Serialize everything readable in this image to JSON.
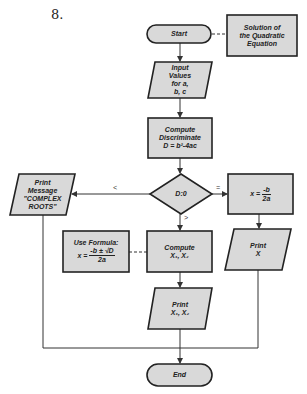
{
  "figure_number": "8.",
  "annotation": {
    "text": "Solution of the Quadratic Equation",
    "lines": [
      "Solution of",
      "the Quadratic",
      "Equation"
    ]
  },
  "nodes": {
    "start": {
      "label": "Start",
      "type": "terminal"
    },
    "input": {
      "lines": [
        "Input",
        "Values",
        "for a,",
        "b, c"
      ],
      "type": "input-output"
    },
    "discriminant": {
      "lines": [
        "Compute",
        "Discriminate",
        "D = b²-4ac"
      ],
      "type": "process"
    },
    "decision": {
      "label": "D:0",
      "type": "decision"
    },
    "complex": {
      "lines": [
        "Print",
        "Message",
        "\"COMPLEX",
        "ROOTS\""
      ],
      "type": "input-output"
    },
    "single_root": {
      "lhs": "x =",
      "numerator": "-b",
      "denominator": "2a",
      "type": "process"
    },
    "formula": {
      "title": "Use Formula:",
      "lhs": "x =",
      "numerator": "-b ± √D",
      "denominator": "2a",
      "type": "annotation-process"
    },
    "compute_roots": {
      "lines": [
        "Compute",
        "X₁, X₂"
      ],
      "type": "process"
    },
    "print_x": {
      "lines": [
        "Print",
        "X"
      ],
      "type": "input-output"
    },
    "print_roots": {
      "lines": [
        "Print",
        "X₁, X₂"
      ],
      "type": "input-output"
    },
    "end": {
      "label": "End",
      "type": "terminal"
    }
  },
  "edge_labels": {
    "less": "<",
    "equal": "=",
    "greater": ">"
  },
  "colors": {
    "fill": "#d9d9d9",
    "stroke": "#222222",
    "background": "#ffffff"
  }
}
